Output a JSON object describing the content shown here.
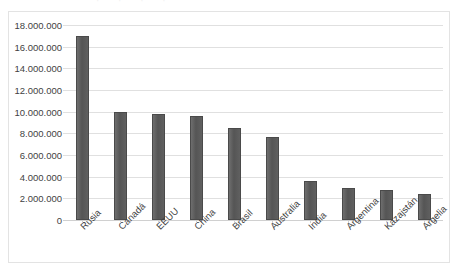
{
  "chart_data": {
    "type": "bar",
    "title": "",
    "xlabel": "",
    "ylabel": "",
    "categories": [
      "Rusia",
      "Canadá",
      "EEUU",
      "China",
      "Brasil",
      "Australia",
      "India",
      "Argentina",
      "Kazajstán",
      "Argelia"
    ],
    "values": [
      17000000,
      10000000,
      9800000,
      9600000,
      8500000,
      7700000,
      3600000,
      3000000,
      2800000,
      2400000
    ],
    "ylim": [
      0,
      18000000
    ],
    "ytick_values": [
      0,
      2000000,
      4000000,
      6000000,
      8000000,
      10000000,
      12000000,
      14000000,
      16000000,
      18000000
    ],
    "ytick_labels": [
      "0",
      "2.000.000",
      "4.000.000",
      "6.000.000",
      "8.000.000",
      "10.000.000",
      "12.000.000",
      "14.000.000",
      "16.000.000",
      "18.000.000"
    ],
    "grid": true,
    "legend": false,
    "legend_position": "none",
    "bar_color": "#595959",
    "gridline_color": "#e0e0e0",
    "plot_background": "#ffffff",
    "border_color": "#e3e3e3",
    "xtick_rotation": -45
  },
  "axes": {
    "y_title": "",
    "x_title": ""
  },
  "figure": {
    "background": "#ffffff",
    "ghost_title": "· · · ·"
  }
}
